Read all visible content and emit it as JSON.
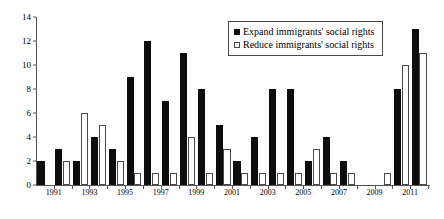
{
  "chart_data": {
    "type": "bar",
    "title": "",
    "subtitle": "",
    "xlabel": "",
    "ylabel": "",
    "ylim": [
      0,
      14
    ],
    "ytick_values": [
      0,
      2,
      4,
      6,
      8,
      10,
      12,
      14
    ],
    "ytick_labels": [
      "0",
      "2",
      "4",
      "6",
      "8",
      "10",
      "12",
      "14"
    ],
    "grid": false,
    "legend_position": "top-right",
    "categories": [
      "1991",
      "1992",
      "1993",
      "1994",
      "1995",
      "1996",
      "1997",
      "1998",
      "1999",
      "2000",
      "2001",
      "2002",
      "2003",
      "2004",
      "2005",
      "2006",
      "2007",
      "2008",
      "2009",
      "2010",
      "2011",
      "2012"
    ],
    "xtick_labels": [
      "1991",
      "1993",
      "1995",
      "1997",
      "1999",
      "2001",
      "2003",
      "2005",
      "2007",
      "2009",
      "2011"
    ],
    "series": [
      {
        "name": "Expand immigrants' social rights",
        "color": "#0d0d0d",
        "style": "filled",
        "values": [
          2,
          3,
          2,
          4,
          3,
          9,
          12,
          7,
          11,
          8,
          5,
          2,
          4,
          8,
          8,
          2,
          4,
          2,
          0,
          0,
          8,
          13
        ]
      },
      {
        "name": "Reduce immigrants' social rights",
        "color": "#ffffff",
        "style": "outlined",
        "values": [
          0,
          2,
          6,
          5,
          2,
          1,
          1,
          1,
          4,
          1,
          3,
          1,
          1,
          1,
          1,
          3,
          1,
          1,
          0,
          1,
          10,
          11
        ]
      }
    ]
  },
  "legend": {
    "items": [
      {
        "label": "Expand immigrants' social rights",
        "swatch": "filled-square-black"
      },
      {
        "label": "Reduce immigrants' social rights",
        "swatch": "outlined-square-white"
      }
    ]
  }
}
